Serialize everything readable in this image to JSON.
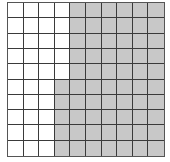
{
  "figure": {
    "type": "hundred-square grid",
    "rows": 10,
    "cols": 10,
    "colors": {
      "shaded": "#c8c8c8",
      "unshaded": "#ffffff",
      "lines": "#3a3a3a"
    },
    "white_cells_per_row": [
      4,
      4,
      4,
      4,
      4,
      3,
      3,
      3,
      3,
      3
    ],
    "shaded_count": 65,
    "unshaded_count": 35,
    "total": 100
  }
}
